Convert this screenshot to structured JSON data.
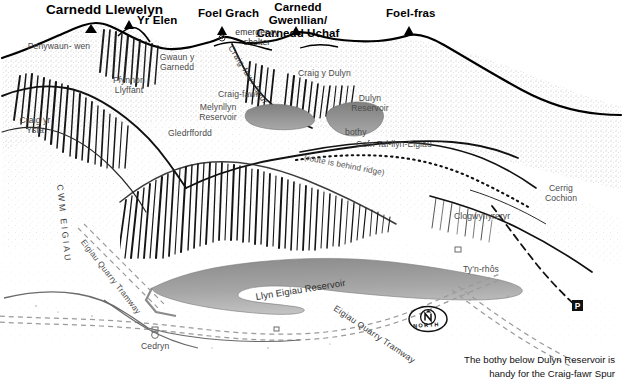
{
  "map": {
    "title_visible": false,
    "caption": "The bothy below Dulyn Reservoir is\nhandy for the Craig-fawr Spur",
    "compass": {
      "label": "NORTH",
      "letter": "N"
    },
    "colors": {
      "ink": "#1a1a1a",
      "paper": "#ffffff",
      "water": "#8f8f8f",
      "water_light": "#b9b9b9",
      "hachure": "#333333",
      "faint": "#6e6e6e"
    },
    "peaks": [
      {
        "name": "Carnedd Llewelyn",
        "x": 46,
        "y": 3,
        "marker_x": 91,
        "marker_y": 24,
        "size": "big"
      },
      {
        "name": "Yr Elen",
        "x": 137,
        "y": 16,
        "marker_x": 129,
        "marker_y": 20,
        "size": "small"
      },
      {
        "name": "Foel Grach",
        "x": 200,
        "y": 9,
        "marker_x": 222,
        "marker_y": 26,
        "size": "small"
      },
      {
        "name": "Carnedd Gwenllian/\nCarnedd Uchaf",
        "x": 249,
        "y": 3,
        "marker_x": 296,
        "marker_y": 26,
        "size": "small"
      },
      {
        "name": "Foel-fras",
        "x": 388,
        "y": 9,
        "marker_x": 409,
        "marker_y": 26,
        "size": "small"
      }
    ],
    "places": [
      {
        "name": "Penywaun-\nwen",
        "x": 28,
        "y": 45
      },
      {
        "name": "Ffynnon\nLlyffant",
        "x": 104,
        "y": 78
      },
      {
        "name": "Craig yr\nYsfa",
        "x": 14,
        "y": 118
      },
      {
        "name": "Gwaun y\nGarnedd",
        "x": 152,
        "y": 55
      },
      {
        "name": "emergency\nshelter",
        "x": 227,
        "y": 30
      },
      {
        "name": "Craig y Dulyn",
        "x": 300,
        "y": 71
      },
      {
        "name": "Craig-fawr",
        "x": 221,
        "y": 92
      },
      {
        "name": "Melynllyn\nReservoir",
        "x": 195,
        "y": 105
      },
      {
        "name": "Dulyn\nReservoir",
        "x": 348,
        "y": 96
      },
      {
        "name": "Gledrffordd",
        "x": 170,
        "y": 131
      },
      {
        "name": "bothy",
        "x": 347,
        "y": 130
      },
      {
        "name": "Cefn Tal-llyn-Eigiau",
        "x": 358,
        "y": 142
      },
      {
        "name": "Cerrig\nCochion",
        "x": 540,
        "y": 186
      },
      {
        "name": "Clogwynyreryr",
        "x": 456,
        "y": 214
      },
      {
        "name": "Ty'n-rhôs",
        "x": 465,
        "y": 267
      },
      {
        "name": "Cedryn",
        "x": 143,
        "y": 344
      }
    ],
    "rotated_labels": [
      {
        "name": "Craig-fawr Spur",
        "x": 233,
        "y": 46
      },
      {
        "name": "Craig-fawr",
        "x": 222,
        "y": 58
      },
      {
        "name": "CWM EIGIAU",
        "x": 62,
        "y": 186
      },
      {
        "name": "Eigiau Quarry Tramway",
        "x": 86,
        "y": 240
      },
      {
        "name": "Eigiau Quarry Tramway",
        "x": 337,
        "y": 306
      },
      {
        "name": "Llyn Eigiau Reservoir",
        "x": 257,
        "y": 290
      },
      {
        "name": "(route is behind ridge)",
        "x": 307,
        "y": 155
      }
    ],
    "markers": [
      {
        "kind": "parking",
        "label": "P",
        "x": 578,
        "y": 306
      },
      {
        "kind": "building",
        "label": "",
        "x": 155,
        "y": 331
      },
      {
        "kind": "building",
        "label": "",
        "x": 458,
        "y": 251
      },
      {
        "kind": "shelter",
        "label": "",
        "x": 222,
        "y": 38
      }
    ],
    "water_bodies": [
      {
        "name": "Melynllyn Reservoir"
      },
      {
        "name": "Dulyn Reservoir"
      },
      {
        "name": "Llyn Eigiau Reservoir"
      }
    ]
  }
}
